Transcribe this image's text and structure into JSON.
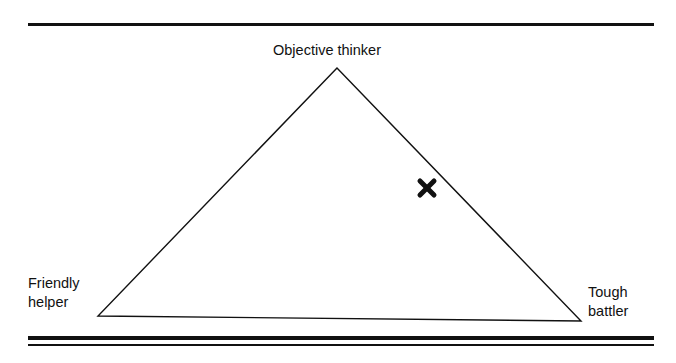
{
  "diagram": {
    "type": "triangle-positioning",
    "vertices": {
      "top": {
        "label": "Objective thinker"
      },
      "bottom_left": {
        "label_line1": "Friendly",
        "label_line2": "helper"
      },
      "bottom_right": {
        "label_line1": "Tough",
        "label_line2": "battler"
      }
    },
    "marker": {
      "symbol": "✖",
      "position": "on right side, near upper edge toward Objective thinker / Tough battler"
    },
    "colors": {
      "ink": "#111111",
      "background": "#ffffff"
    }
  }
}
